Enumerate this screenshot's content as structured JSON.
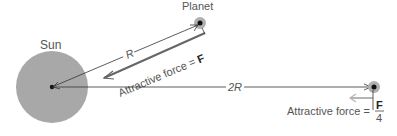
{
  "labels": {
    "sun": "Sun",
    "planet": "Planet",
    "distance_near": "R",
    "distance_far": "2R",
    "force_near_text": "Attractive force = ",
    "force_near_symbol": "F",
    "force_far_text": "Attractive force = ",
    "force_far_numerator": "F",
    "force_far_denominator": "4"
  },
  "colors": {
    "sun_fill": "#a8a8a8",
    "planet_glow": "#b0b0b0",
    "line": "#333333",
    "force_arrow": "#666666",
    "far_force_arrow": "#b5b5b5"
  }
}
